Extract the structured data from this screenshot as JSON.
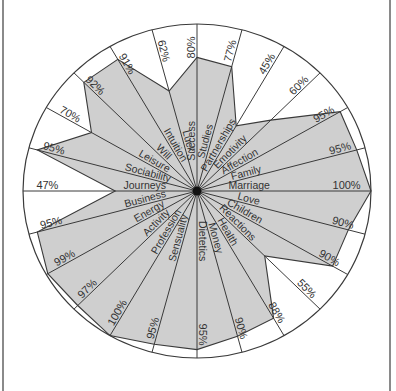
{
  "chart_data": {
    "type": "radar",
    "title": "",
    "layout": {
      "center": [
        197,
        191
      ],
      "radius_x": 174,
      "radius_y": 167,
      "start_angle_deg": -90,
      "direction": "clockwise",
      "fill_color": "#cfcfcf",
      "line_color": "#3a3a3a",
      "background": "#ffffff",
      "value_range": [
        0,
        100
      ],
      "unit": "%"
    },
    "categories": [
      "Success",
      "Studies",
      "Partnerships",
      "Emotivity",
      "Affection",
      "Family",
      "Marriage",
      "Love",
      "Children",
      "Reactions",
      "Health",
      "Money",
      "Dietetics",
      "Sensuality",
      "Profession",
      "Activity",
      "Energy",
      "Business",
      "Journeys",
      "Sociability",
      "Leisure",
      "Will",
      "Intuition",
      "Luck"
    ],
    "values": [
      80,
      77,
      45,
      60,
      95,
      95,
      100,
      90,
      90,
      55,
      88,
      90,
      95,
      95,
      100,
      97,
      99,
      95,
      47,
      95,
      70,
      92,
      91,
      62
    ],
    "labels": [
      "80%",
      "77%",
      "45%",
      "60%",
      "95%",
      "95%",
      "100%",
      "90%",
      "90%",
      "55%",
      "88%",
      "90%",
      "95%",
      "95%",
      "100%",
      "97%",
      "99%",
      "95%",
      "47%",
      "95%",
      "70%",
      "92%",
      "91%",
      "62%"
    ]
  }
}
